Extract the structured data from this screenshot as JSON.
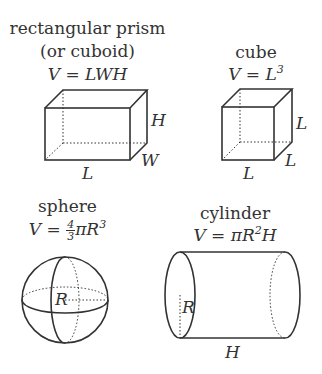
{
  "shapes": {
    "prism": {
      "name_line1": "rectangular prism",
      "name_line2": "(or cuboid)",
      "formula": "V = LWH",
      "labels": {
        "height": "H",
        "width": "W",
        "length": "L"
      }
    },
    "cube": {
      "name": "cube",
      "formula_base": "V = L",
      "formula_exp": "3",
      "labels": {
        "height": "L",
        "depth": "L",
        "length": "L"
      }
    },
    "sphere": {
      "name": "sphere",
      "formula_left": "V =",
      "frac_num": "4",
      "frac_den": "3",
      "formula_right": "πR",
      "formula_exp": "3",
      "labels": {
        "radius": "R"
      }
    },
    "cylinder": {
      "name": "cylinder",
      "formula_base": "V = πR",
      "formula_exp": "2",
      "formula_tail": "H",
      "labels": {
        "radius": "R",
        "height": "H"
      }
    }
  },
  "colors": {
    "stroke": "#333333",
    "background": "#ffffff"
  }
}
